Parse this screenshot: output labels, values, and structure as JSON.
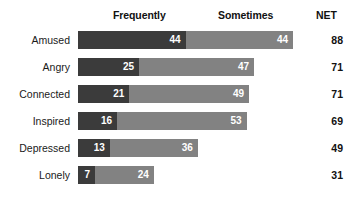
{
  "chart_data": {
    "type": "bar",
    "subtype": "stacked-horizontal",
    "title": "",
    "xlabel": "",
    "ylabel": "",
    "categories": [
      "Amused",
      "Angry",
      "Connected",
      "Inspired",
      "Depressed",
      "Lonely"
    ],
    "series": [
      {
        "name": "Frequently",
        "values": [
          44,
          25,
          21,
          16,
          13,
          7
        ],
        "color": "#3b3b3b"
      },
      {
        "name": "Sometimes",
        "values": [
          44,
          47,
          49,
          53,
          36,
          24
        ],
        "color": "#828282"
      }
    ],
    "net": {
      "label": "NET",
      "values": [
        88,
        71,
        71,
        69,
        49,
        31
      ]
    },
    "xlim": [
      0,
      88
    ],
    "grid": false,
    "legend": "top-inline",
    "value_labels": true
  },
  "header": {
    "frequently": "Frequently",
    "sometimes": "Sometimes",
    "net": "NET"
  },
  "rows": [
    {
      "label": "Amused",
      "frequently": 44,
      "sometimes": 44,
      "net": 88
    },
    {
      "label": "Angry",
      "frequently": 25,
      "sometimes": 47,
      "net": 71
    },
    {
      "label": "Connected",
      "frequently": 21,
      "sometimes": 49,
      "net": 71
    },
    {
      "label": "Inspired",
      "frequently": 16,
      "sometimes": 53,
      "net": 69
    },
    {
      "label": "Depressed",
      "frequently": 13,
      "sometimes": 36,
      "net": 49
    },
    {
      "label": "Lonely",
      "frequently": 7,
      "sometimes": 24,
      "net": 31
    }
  ],
  "colors": {
    "frequently": "#3b3b3b",
    "sometimes": "#828282",
    "background": "#ffffff",
    "text": "#1a1a1a"
  }
}
